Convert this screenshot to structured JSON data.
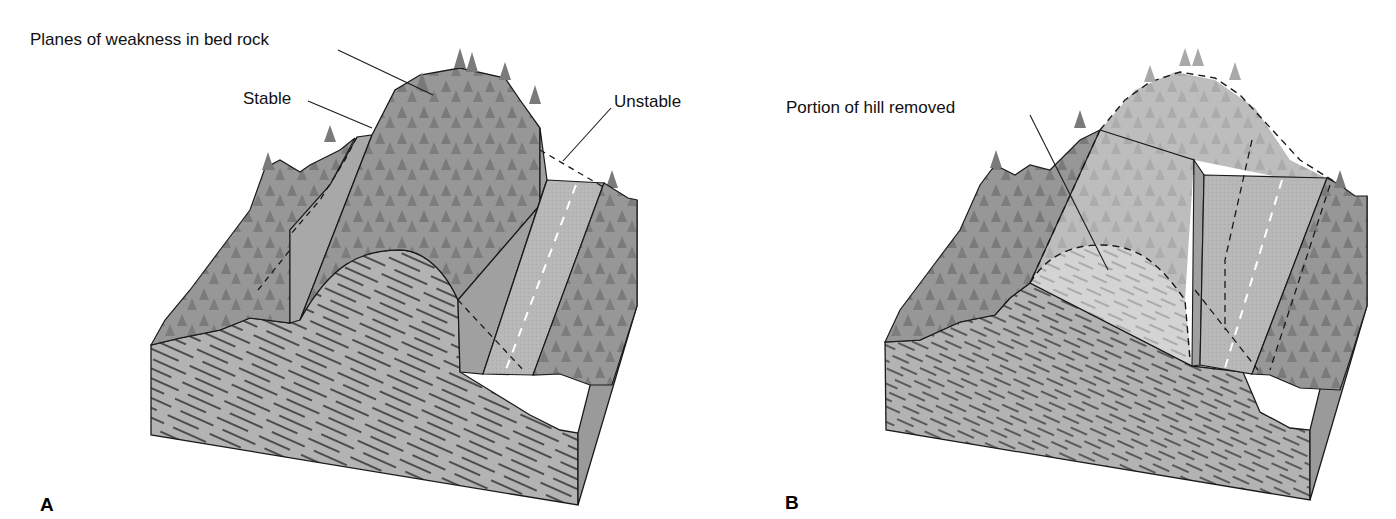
{
  "panels": [
    {
      "id": "A",
      "letter": "A",
      "labels": {
        "planes": "Planes of weakness in bed rock",
        "stable": "Stable",
        "unstable": "Unstable"
      }
    },
    {
      "id": "B",
      "letter": "B",
      "labels": {
        "removed": "Portion of hill removed"
      }
    }
  ],
  "colors": {
    "forest": "#8e8e8e",
    "forest_dark": "#6f6f6f",
    "road": "#b9b9b9",
    "rock": "#b3b3b3",
    "rock_side": "#9a9a9a",
    "removed": "#cfcfcf",
    "outline": "#1a1a1a"
  }
}
